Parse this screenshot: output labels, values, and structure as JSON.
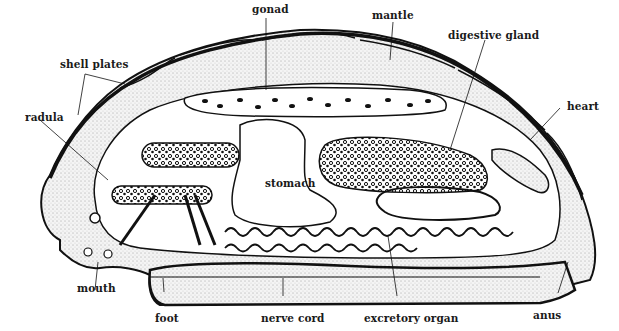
{
  "diagram": {
    "colors": {
      "ink": "#111111",
      "stipple_fill": "#e6e6e6",
      "background": "#ffffff"
    },
    "labels": {
      "gonad": "gonad",
      "mantle": "mantle",
      "digestive_gland": "digestive gland",
      "shell_plates": "shell plates",
      "heart": "heart",
      "radula": "radula",
      "stomach": "stomach",
      "mouth": "mouth",
      "foot": "foot",
      "nerve_cord": "nerve cord",
      "excretory_organ": "excretory organ",
      "anus": "anus"
    }
  }
}
